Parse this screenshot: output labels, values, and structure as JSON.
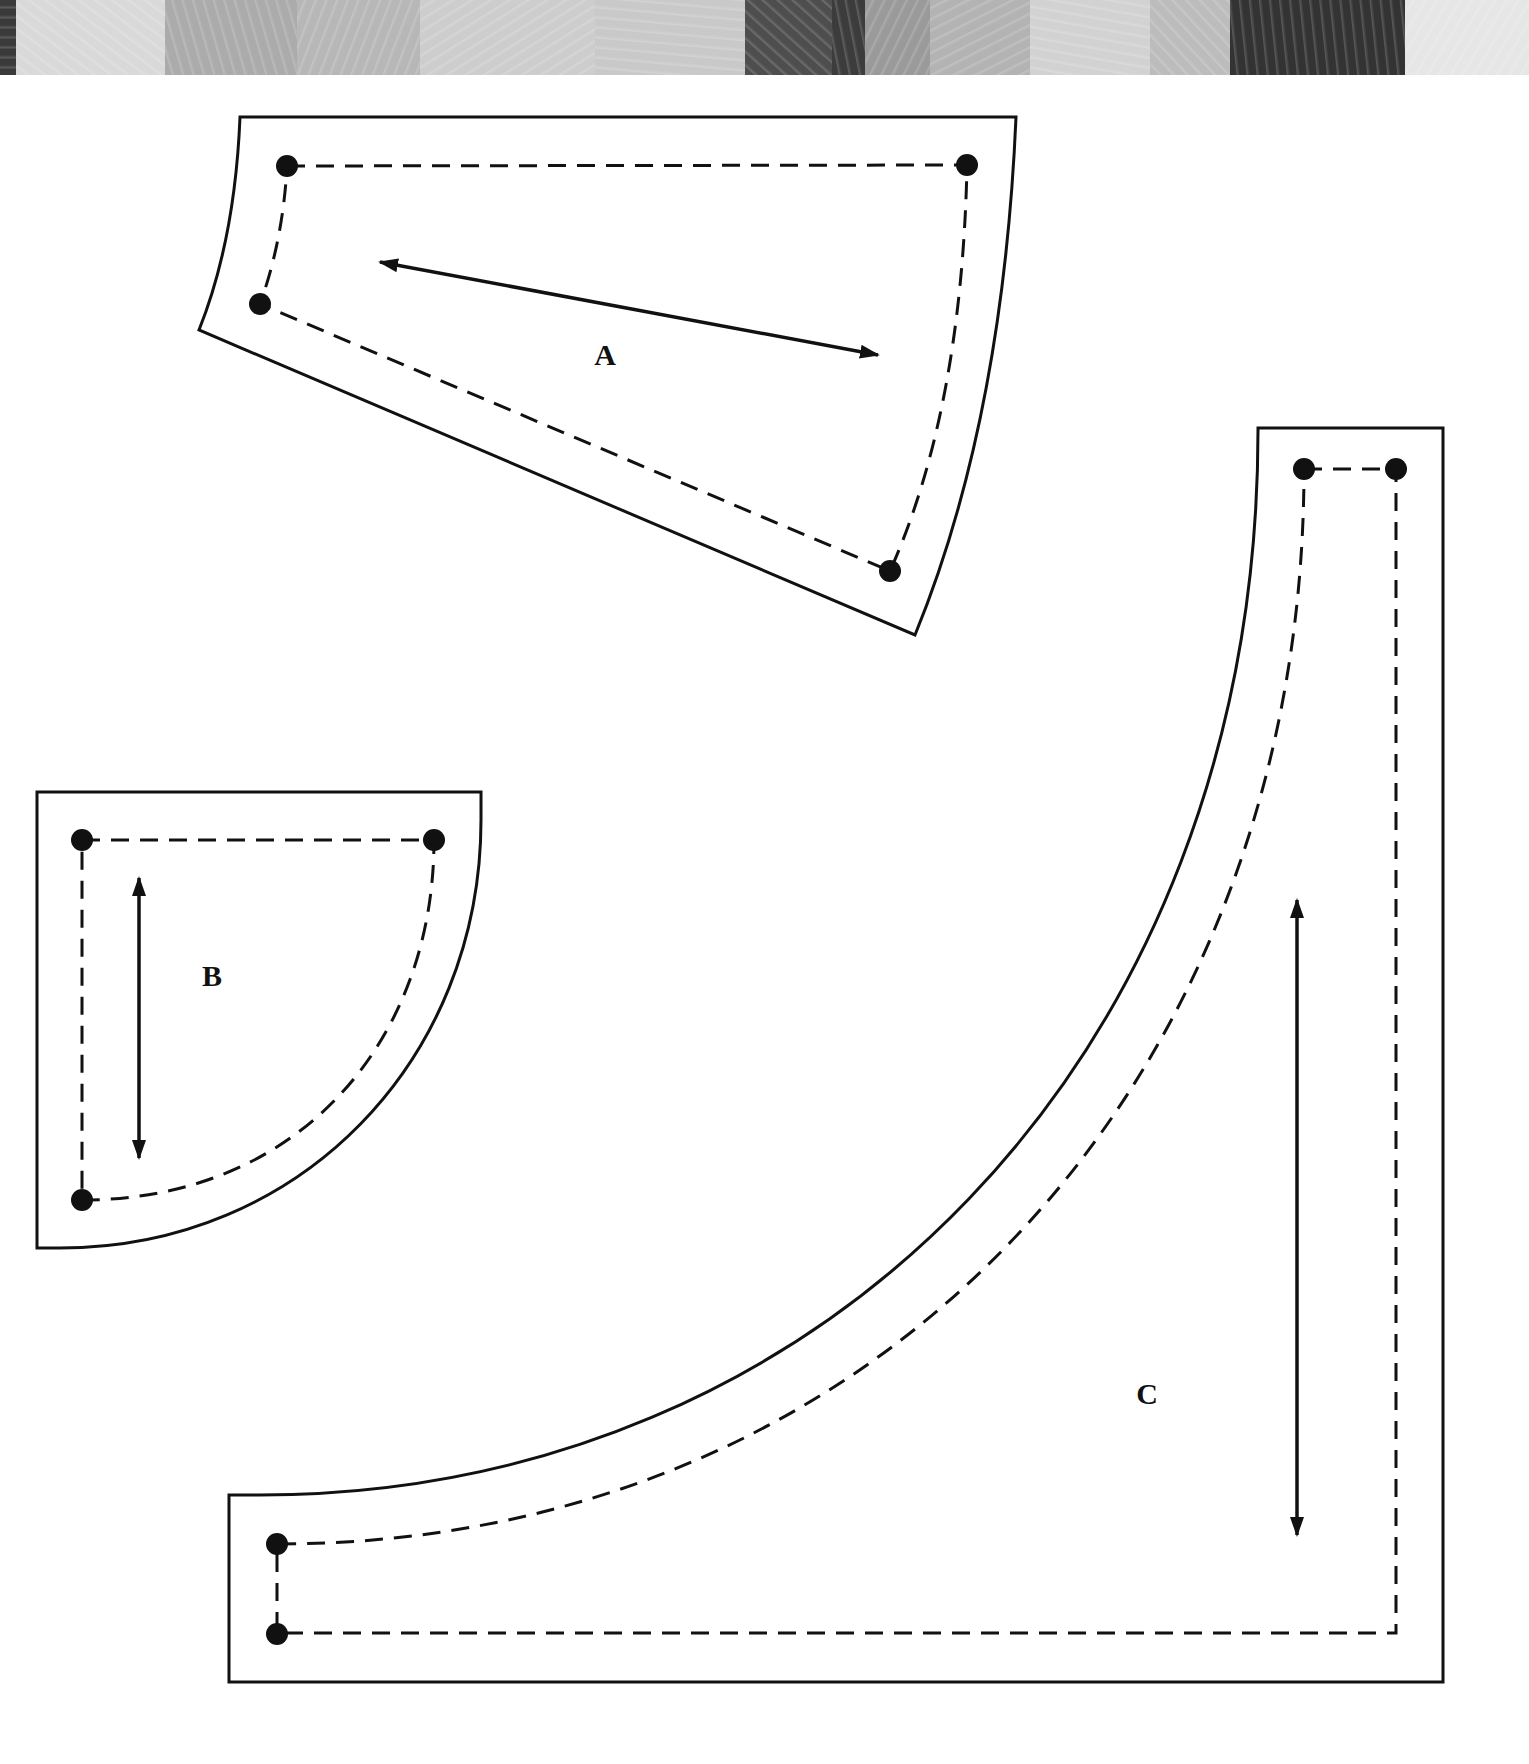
{
  "fabric_strip": {
    "description": "decorative band of grayscale fabric swatches",
    "bands": [
      {
        "width": 16,
        "color": "#3a3a3a",
        "pattern": "solid"
      },
      {
        "width": 149,
        "color": "#d9d9d9",
        "pattern": "leafy"
      },
      {
        "width": 132,
        "color": "#ababab",
        "pattern": "damask"
      },
      {
        "width": 123,
        "color": "#b7b7b7",
        "pattern": "scroll"
      },
      {
        "width": 175,
        "color": "#cdcdcd",
        "pattern": "mottled"
      },
      {
        "width": 150,
        "color": "#c9c9c9",
        "pattern": "floral"
      },
      {
        "width": 87,
        "color": "#4e4e4e",
        "pattern": "textured"
      },
      {
        "width": 33,
        "color": "#3c3c3c",
        "pattern": "stripe"
      },
      {
        "width": 65,
        "color": "#9a9a9a",
        "pattern": "floral"
      },
      {
        "width": 100,
        "color": "#b3b3b3",
        "pattern": "mottled"
      },
      {
        "width": 120,
        "color": "#d2d2d2",
        "pattern": "mottled"
      },
      {
        "width": 80,
        "color": "#bcbcbc",
        "pattern": "geometric"
      },
      {
        "width": 175,
        "color": "#333333",
        "pattern": "textured"
      },
      {
        "width": 124,
        "color": "#e6e6e6",
        "pattern": "mottled"
      }
    ]
  },
  "colors": {
    "line": "#111111",
    "background": "#ffffff"
  },
  "pieces": [
    {
      "id": "A",
      "label": "A",
      "grain_arrow": "double-headed, diagonal",
      "seam_dots": 4
    },
    {
      "id": "B",
      "label": "B",
      "grain_arrow": "double-headed, vertical",
      "seam_dots": 3
    },
    {
      "id": "C",
      "label": "C",
      "grain_arrow": "double-headed, vertical",
      "seam_dots": 4
    }
  ]
}
